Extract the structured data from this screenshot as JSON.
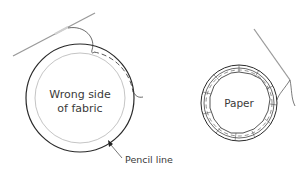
{
  "diagram": {
    "left": {
      "label_line1": "Wrong side",
      "label_line2": "of fabric",
      "callout": "Pencil line"
    },
    "right": {
      "label": "Paper"
    }
  },
  "colors": {
    "outline": "#2a2a2a",
    "inner_line": "#b0b0b0",
    "needle": "#9a9a9a",
    "text": "#3a3a3a"
  }
}
